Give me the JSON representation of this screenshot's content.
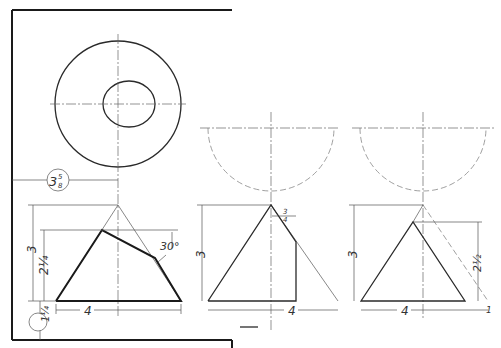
{
  "figure": {
    "type": "technical-drawing",
    "views": [
      {
        "name": "left-view",
        "top_view": "concentric circles (outer circle with inner ellipse)",
        "dimensions": {
          "offset": "3 5/8",
          "height": "3",
          "cut_height": "2 1/4",
          "angle": "30°",
          "base": "4",
          "bottom_offset": "1 1/4"
        }
      },
      {
        "name": "middle-view",
        "top_view": "dashed semicircle",
        "dimensions": {
          "height": "3",
          "offset": "3/4",
          "base": "4"
        }
      },
      {
        "name": "right-view",
        "top_view": "dashed semicircle",
        "dimensions": {
          "height": "3",
          "cut_height": "2 1/2",
          "base": "4",
          "offset": "1"
        }
      }
    ]
  },
  "labels": {
    "l_offset_whole": "3",
    "l_offset_num": "5",
    "l_offset_den": "8",
    "l_height": "3",
    "l_cut": "2¼",
    "l_angle": "30°",
    "l_base": "4",
    "l_bottom": "1¼",
    "m_height": "3",
    "m_off_num": "3",
    "m_off_den": "4",
    "m_base": "4",
    "r_height": "3",
    "r_cut": "2½",
    "r_base": "4",
    "r_off": "1"
  }
}
